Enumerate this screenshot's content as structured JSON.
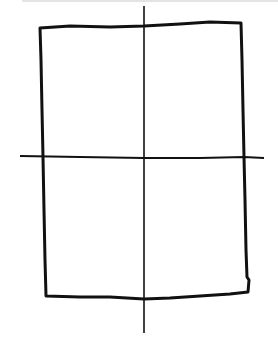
{
  "diagram": {
    "stroke_color": "#111111",
    "background": "#ffffff",
    "rectangle": {
      "x1": 40,
      "y1": 24,
      "x2": 246,
      "y2": 298
    },
    "vertical_line": {
      "x": 144,
      "y1": 6,
      "y2": 332
    },
    "horizontal_line": {
      "y": 157,
      "x1": 20,
      "x2": 264
    }
  }
}
